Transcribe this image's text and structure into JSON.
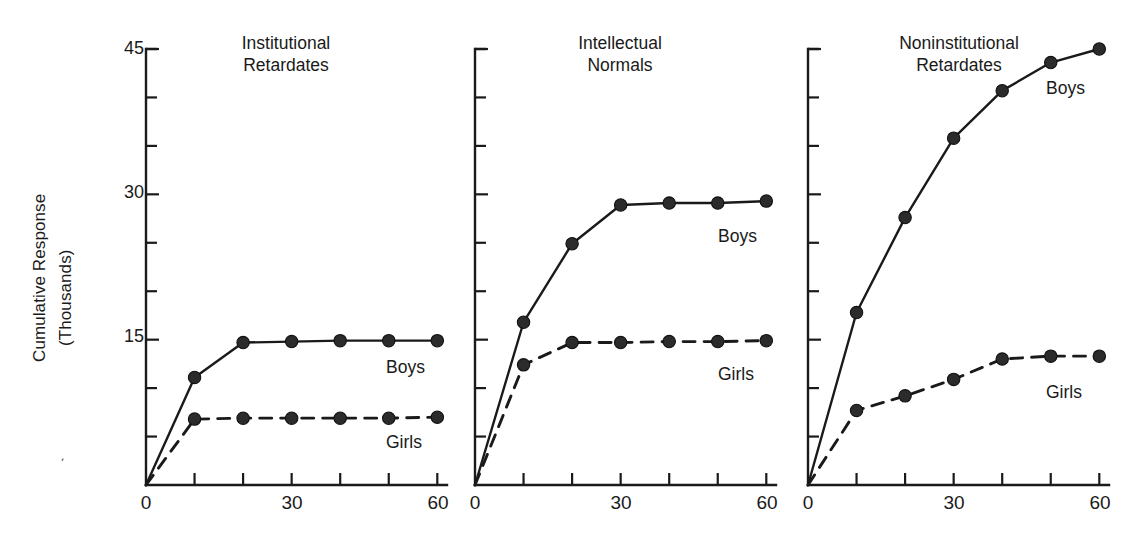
{
  "axis": {
    "y_label_line1": "Cumulative Response",
    "y_label_line2": "(Thousands)",
    "y_ticks_major": [
      "45",
      "30",
      "15"
    ],
    "x_ticks_major": [
      "0",
      "30",
      "60"
    ],
    "y_tick_45": "45",
    "y_tick_30": "30",
    "y_tick_15": "15",
    "x_tick_0": "0",
    "x_tick_30": "30",
    "x_tick_60": "60"
  },
  "panels": [
    {
      "title_line1": "Institutional",
      "title_line2": "Retardates",
      "boys_label": "Boys",
      "girls_label": "Girls"
    },
    {
      "title_line1": "Intellectual",
      "title_line2": "Normals",
      "boys_label": "Boys",
      "girls_label": "Girls"
    },
    {
      "title_line1": "Noninstitutional",
      "title_line2": "Retardates",
      "boys_label": "Boys",
      "girls_label": "Girls"
    }
  ],
  "stray_mark": "'",
  "colors": {
    "ink": "#1a1a1a",
    "background": "#ffffff"
  },
  "chart_data": {
    "type": "line",
    "title": "",
    "xlabel": "",
    "ylabel": "Cumulative Response (Thousands)",
    "xlim": [
      0,
      62
    ],
    "ylim": [
      0,
      45
    ],
    "x": [
      0,
      10,
      20,
      30,
      40,
      50,
      60
    ],
    "y_ticks": [
      0,
      5,
      10,
      15,
      20,
      25,
      30,
      35,
      40,
      45
    ],
    "y_ticks_labeled": [
      15,
      30,
      45
    ],
    "x_ticks": [
      0,
      10,
      20,
      30,
      40,
      50,
      60
    ],
    "x_ticks_labeled": [
      0,
      30,
      60
    ],
    "grid": false,
    "legend": "inline-annotations",
    "panels": [
      {
        "name": "Institutional Retardates",
        "series": [
          {
            "name": "Boys",
            "style": "solid",
            "values": [
              0,
              11.1,
              14.7,
              14.8,
              14.9,
              14.9,
              14.9
            ]
          },
          {
            "name": "Girls",
            "style": "dashed",
            "values": [
              0,
              6.8,
              6.9,
              6.9,
              6.9,
              6.9,
              7.0
            ]
          }
        ]
      },
      {
        "name": "Intellectual Normals",
        "series": [
          {
            "name": "Boys",
            "style": "solid",
            "values": [
              0,
              16.8,
              24.9,
              28.9,
              29.1,
              29.1,
              29.3
            ]
          },
          {
            "name": "Girls",
            "style": "dashed",
            "values": [
              0,
              12.4,
              14.7,
              14.7,
              14.8,
              14.8,
              14.9
            ]
          }
        ]
      },
      {
        "name": "Noninstitutional Retardates",
        "series": [
          {
            "name": "Boys",
            "style": "solid",
            "values": [
              0,
              17.8,
              27.6,
              35.8,
              40.7,
              43.6,
              45.0
            ]
          },
          {
            "name": "Girls",
            "style": "dashed",
            "values": [
              0,
              7.7,
              9.2,
              10.9,
              13.0,
              13.3,
              13.3
            ]
          }
        ]
      }
    ]
  }
}
